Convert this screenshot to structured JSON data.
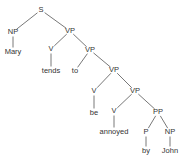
{
  "diagram": {
    "type": "syntax-tree",
    "nodes": [
      {
        "id": "S",
        "label": "S",
        "x": 41,
        "y": 10
      },
      {
        "id": "NP1",
        "label": "NP",
        "x": 13,
        "y": 32
      },
      {
        "id": "Mary",
        "label": "Mary",
        "x": 13,
        "y": 52
      },
      {
        "id": "VP1",
        "label": "VP",
        "x": 70,
        "y": 31
      },
      {
        "id": "V1",
        "label": "V",
        "x": 51,
        "y": 49
      },
      {
        "id": "tends",
        "label": "tends",
        "x": 51,
        "y": 71
      },
      {
        "id": "VP2",
        "label": "VP",
        "x": 90,
        "y": 50
      },
      {
        "id": "to",
        "label": "to",
        "x": 75,
        "y": 71
      },
      {
        "id": "VP3",
        "label": "VP",
        "x": 114,
        "y": 70
      },
      {
        "id": "V2",
        "label": "V",
        "x": 94,
        "y": 91
      },
      {
        "id": "be",
        "label": "be",
        "x": 94,
        "y": 113
      },
      {
        "id": "VP4",
        "label": "VP",
        "x": 135,
        "y": 91
      },
      {
        "id": "V3",
        "label": "V",
        "x": 114,
        "y": 111
      },
      {
        "id": "annoyed",
        "label": "annoyed",
        "x": 114,
        "y": 132
      },
      {
        "id": "PP",
        "label": "PP",
        "x": 158,
        "y": 112
      },
      {
        "id": "P",
        "label": "P",
        "x": 146,
        "y": 132
      },
      {
        "id": "by",
        "label": "by",
        "x": 146,
        "y": 151
      },
      {
        "id": "NP2",
        "label": "NP",
        "x": 170,
        "y": 132
      },
      {
        "id": "John",
        "label": "John",
        "x": 170,
        "y": 151
      }
    ],
    "edges": [
      [
        "S",
        "NP1"
      ],
      [
        "S",
        "VP1"
      ],
      [
        "NP1",
        "Mary"
      ],
      [
        "VP1",
        "V1"
      ],
      [
        "VP1",
        "VP2"
      ],
      [
        "V1",
        "tends"
      ],
      [
        "VP2",
        "to"
      ],
      [
        "VP2",
        "VP3"
      ],
      [
        "VP3",
        "V2"
      ],
      [
        "VP3",
        "VP4"
      ],
      [
        "V2",
        "be"
      ],
      [
        "VP4",
        "V3"
      ],
      [
        "VP4",
        "PP"
      ],
      [
        "V3",
        "annoyed"
      ],
      [
        "PP",
        "P"
      ],
      [
        "PP",
        "NP2"
      ],
      [
        "P",
        "by"
      ],
      [
        "NP2",
        "John"
      ]
    ],
    "sentence": "Mary tends to be annoyed by John"
  }
}
